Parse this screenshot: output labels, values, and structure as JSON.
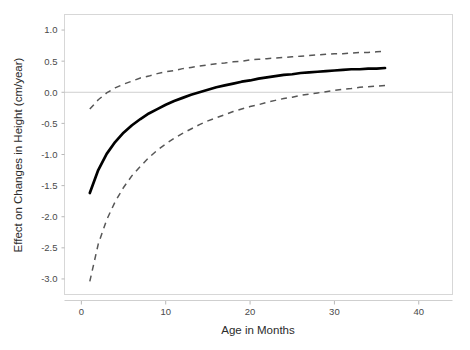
{
  "chart_data": {
    "type": "line",
    "title": "",
    "xlabel": "Age in Months",
    "ylabel": "Effect on Changes in Height (cm/year)",
    "xlim": [
      -2,
      44
    ],
    "ylim": [
      -3.25,
      1.25
    ],
    "xticks": [
      0,
      10,
      20,
      30,
      40
    ],
    "xtick_labels": [
      "0",
      "10",
      "20",
      "30",
      "40"
    ],
    "yticks": [
      1.0,
      0.5,
      0.0,
      -0.5,
      -1.0,
      -1.5,
      -2.0,
      -2.5,
      -3.0
    ],
    "ytick_labels": [
      "1.0",
      "0.5",
      "0.0",
      "-0.5",
      "-1.0",
      "-1.5",
      "-2.0",
      "-2.5",
      "-3.0"
    ],
    "grid": false,
    "legend": "none",
    "reference_lines": [
      {
        "axis": "y",
        "value": 0.0,
        "color": "#cfcfcf"
      }
    ],
    "x": [
      1,
      2,
      3,
      4,
      5,
      6,
      7,
      8,
      9,
      10,
      11,
      12,
      13,
      14,
      15,
      16,
      17,
      18,
      19,
      20,
      21,
      22,
      23,
      24,
      25,
      26,
      27,
      28,
      29,
      30,
      31,
      32,
      33,
      34,
      35,
      36
    ],
    "series": [
      {
        "name": "Estimated effect",
        "style": "solid",
        "color": "#000000",
        "values": [
          -1.62,
          -1.25,
          -0.99,
          -0.8,
          -0.65,
          -0.53,
          -0.43,
          -0.34,
          -0.27,
          -0.2,
          -0.14,
          -0.09,
          -0.04,
          0.0,
          0.04,
          0.08,
          0.11,
          0.14,
          0.17,
          0.19,
          0.22,
          0.24,
          0.26,
          0.28,
          0.29,
          0.31,
          0.32,
          0.33,
          0.34,
          0.35,
          0.36,
          0.37,
          0.37,
          0.38,
          0.38,
          0.39
        ]
      },
      {
        "name": "Upper 95% confidence limit",
        "style": "dashed",
        "color": "#575757",
        "values": [
          -0.27,
          -0.12,
          -0.01,
          0.07,
          0.13,
          0.18,
          0.23,
          0.26,
          0.3,
          0.33,
          0.35,
          0.38,
          0.4,
          0.42,
          0.44,
          0.46,
          0.47,
          0.49,
          0.5,
          0.52,
          0.53,
          0.54,
          0.55,
          0.56,
          0.57,
          0.58,
          0.59,
          0.6,
          0.61,
          0.62,
          0.62,
          0.63,
          0.64,
          0.64,
          0.65,
          0.66
        ]
      },
      {
        "name": "Lower 95% confidence limit",
        "style": "dashed",
        "color": "#575757",
        "values": [
          -3.04,
          -2.44,
          -2.05,
          -1.76,
          -1.53,
          -1.34,
          -1.19,
          -1.05,
          -0.93,
          -0.83,
          -0.74,
          -0.66,
          -0.59,
          -0.52,
          -0.46,
          -0.41,
          -0.36,
          -0.31,
          -0.27,
          -0.23,
          -0.2,
          -0.16,
          -0.13,
          -0.1,
          -0.08,
          -0.05,
          -0.03,
          -0.01,
          0.01,
          0.03,
          0.05,
          0.06,
          0.08,
          0.09,
          0.1,
          0.11
        ]
      }
    ]
  }
}
